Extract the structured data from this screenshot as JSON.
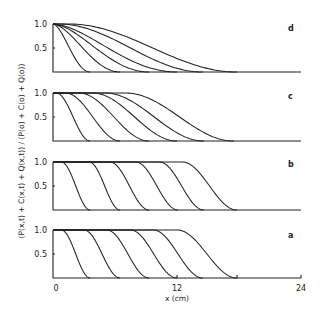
{
  "chart_data": {
    "type": "line",
    "title": "",
    "xlabel": "x (cm)",
    "ylabel": "(P(x,t) + C(x,t) + Q(x,t)) / (P(o) + C(o) + Q(o))",
    "xlim": [
      0,
      24
    ],
    "xticks": [
      "0",
      "12",
      "24"
    ],
    "ylim": [
      0,
      1.0
    ],
    "yticks": [
      "0.5",
      "1.0"
    ],
    "grid": false,
    "legend": "none",
    "panels": [
      {
        "label": "d",
        "curves": [
          {
            "x_start_drop": 0.0,
            "x_zero": 3.6
          },
          {
            "x_start_drop": 0.0,
            "x_zero": 6.5
          },
          {
            "x_start_drop": 0.0,
            "x_zero": 9.3
          },
          {
            "x_start_drop": 0.0,
            "x_zero": 12.0
          },
          {
            "x_start_drop": 0.5,
            "x_zero": 14.5
          },
          {
            "x_start_drop": 1.5,
            "x_zero": 17.8
          }
        ]
      },
      {
        "label": "c",
        "curves": [
          {
            "x_start_drop": 0.3,
            "x_zero": 3.6
          },
          {
            "x_start_drop": 1.2,
            "x_zero": 6.5
          },
          {
            "x_start_drop": 2.5,
            "x_zero": 9.3
          },
          {
            "x_start_drop": 3.8,
            "x_zero": 12.0
          },
          {
            "x_start_drop": 5.0,
            "x_zero": 14.6
          },
          {
            "x_start_drop": 7.0,
            "x_zero": 17.5
          }
        ]
      },
      {
        "label": "b",
        "curves": [
          {
            "x_start_drop": 0.8,
            "x_zero": 3.6
          },
          {
            "x_start_drop": 3.5,
            "x_zero": 6.5
          },
          {
            "x_start_drop": 5.5,
            "x_zero": 9.3
          },
          {
            "x_start_drop": 8.0,
            "x_zero": 12.1
          },
          {
            "x_start_drop": 10.3,
            "x_zero": 14.6
          },
          {
            "x_start_drop": 12.5,
            "x_zero": 17.8
          }
        ]
      },
      {
        "label": "a",
        "curves": [
          {
            "x_start_drop": 0.8,
            "x_zero": 3.6
          },
          {
            "x_start_drop": 3.0,
            "x_zero": 6.5
          },
          {
            "x_start_drop": 5.2,
            "x_zero": 9.3
          },
          {
            "x_start_drop": 7.5,
            "x_zero": 12.0
          },
          {
            "x_start_drop": 9.7,
            "x_zero": 14.5
          },
          {
            "x_start_drop": 12.0,
            "x_zero": 17.8
          }
        ]
      }
    ]
  },
  "labels": {
    "y_axis": "(P(x,t) + C(x,t) + Q(x,t)) / (P(o) + C(o) + Q(o))",
    "x_axis": "x (cm)",
    "x_tick_0": "0",
    "x_tick_12": "12",
    "x_tick_24": "24",
    "y_tick_1": "1.0",
    "y_tick_05": "0.5",
    "panel_d": "d",
    "panel_c": "c",
    "panel_b": "b",
    "panel_a": "a"
  }
}
